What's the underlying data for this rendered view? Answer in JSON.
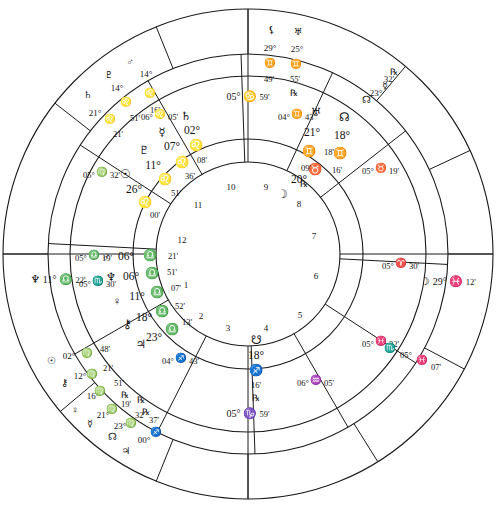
{
  "chart": {
    "type": "astrology-wheel",
    "geometry": {
      "cx": 248,
      "cy": 254,
      "r_outer": 245,
      "r_ring1": 200,
      "r_ring2": 178,
      "r_ring3": 115,
      "r_inner": 92
    },
    "stroke": "#1a1a1a",
    "background": "#ffffff"
  },
  "glyphs": {
    "sun": "☉",
    "moon": "☽",
    "mercury": "☿",
    "venus": "♀",
    "mars": "♂",
    "jupiter": "♃",
    "saturn": "♄",
    "uranus": "♅",
    "neptune": "♆",
    "pluto": "♇",
    "chiron": "⚷",
    "lilith": "⚸",
    "north-node": "☊",
    "south-node": "☋",
    "retrograde": "℞",
    "aries": "♈",
    "taurus": "♉",
    "gemini": "♊",
    "cancer": "♋",
    "leo": "♌",
    "virgo": "♍",
    "libra": "♎",
    "scorpio": "♏",
    "sagittarius": "♐",
    "capricorn": "♑",
    "aquarius": "♒",
    "pisces": "♓"
  },
  "axes": {
    "mc": {
      "name": "midheaven",
      "degree": "05°",
      "sign": "♋",
      "minute": "59'",
      "x": 248,
      "y": 96
    },
    "ic": {
      "name": "imum-coeli",
      "degree": "05°",
      "sign": "♑",
      "minute": "59'",
      "x": 248,
      "y": 413
    },
    "asc": {
      "name": "ascendant",
      "glyph": "♆",
      "degree": "11°",
      "sign": "♎",
      "minute": "22'",
      "x": 58,
      "y": 279
    },
    "dsc": {
      "name": "descendant",
      "glyph": "☽",
      "degree": "29°",
      "sign": "♓",
      "minute": "12'",
      "x": 448,
      "y": 281
    }
  },
  "house_numbers": [
    {
      "n": "1",
      "x": 186,
      "y": 285
    },
    {
      "n": "2",
      "x": 201,
      "y": 316
    },
    {
      "n": "3",
      "x": 228,
      "y": 328
    },
    {
      "n": "4",
      "x": 266,
      "y": 328
    },
    {
      "n": "5",
      "x": 300,
      "y": 315
    },
    {
      "n": "6",
      "x": 316,
      "y": 276
    },
    {
      "n": "7",
      "x": 314,
      "y": 236
    },
    {
      "n": "8",
      "x": 299,
      "y": 204
    },
    {
      "n": "9",
      "x": 266,
      "y": 187
    },
    {
      "n": "10",
      "x": 231,
      "y": 187
    },
    {
      "n": "11",
      "x": 198,
      "y": 205
    },
    {
      "n": "12",
      "x": 182,
      "y": 240
    }
  ],
  "inner_cusps": [
    {
      "name": "cusp-11",
      "degree": "06°",
      "sign": "♌",
      "minute": "05'",
      "x": 160,
      "y": 117
    },
    {
      "name": "cusp-10",
      "degree": "04°",
      "sign": "♊",
      "minute": "43'",
      "x": 297,
      "y": 117
    },
    {
      "name": "cusp-9",
      "degree": "05°",
      "sign": "♉",
      "minute": "19'",
      "x": 381,
      "y": 171
    },
    {
      "name": "cusp-8",
      "degree": "05°",
      "sign": "♈",
      "minute": "30'",
      "x": 401,
      "y": 266
    },
    {
      "name": "cusp-7",
      "degree": "05°",
      "sign": "♓",
      "minute": "32'",
      "x": 381,
      "y": 344
    },
    {
      "name": "cusp-6",
      "degree": "06°",
      "sign": "♒",
      "minute": "05'",
      "x": 316,
      "y": 383
    },
    {
      "name": "cusp-5",
      "degree": "04°",
      "sign": "♐",
      "minute": "43'",
      "x": 181,
      "y": 361
    },
    {
      "name": "cusp-4",
      "degree": "05°",
      "sign": "♏",
      "minute": "30'",
      "x": 98,
      "y": 284
    },
    {
      "name": "cusp-3",
      "degree": "05°",
      "sign": "♎",
      "minute": "19'",
      "x": 94,
      "y": 258
    },
    {
      "name": "cusp-2",
      "degree": "05°",
      "sign": "♍",
      "minute": "32'",
      "x": 102,
      "y": 175
    }
  ],
  "asc_marker": {
    "name": "ascendant-marker",
    "label": "♏",
    "degree": "05°",
    "sign": "♓",
    "minute": "07'",
    "x": 406,
    "y": 355
  },
  "inner_planets": [
    {
      "name": "saturn",
      "glyph": "♄",
      "degree": "02°",
      "sign": "♌",
      "minute": "08'",
      "retro": "",
      "gx": 186,
      "gy": 117,
      "dx": 192,
      "dy": 131,
      "sx": 196,
      "sy": 146,
      "mx": 202,
      "my": 160,
      "rx": 0,
      "ry": 0
    },
    {
      "name": "mercury",
      "glyph": "☿",
      "degree": "07°",
      "sign": "♌",
      "minute": "36'",
      "retro": "",
      "gx": 162,
      "gy": 133,
      "dx": 172,
      "dy": 147,
      "sx": 182,
      "sy": 163,
      "mx": 190,
      "my": 176,
      "rx": 0,
      "ry": 0
    },
    {
      "name": "pluto",
      "glyph": "♇",
      "degree": "11°",
      "sign": "♌",
      "minute": "51'",
      "retro": "",
      "gx": 144,
      "gy": 151,
      "dx": 153,
      "dy": 166,
      "sx": 165,
      "sy": 180,
      "mx": 176,
      "my": 193,
      "rx": 0,
      "ry": 0
    },
    {
      "name": "sun",
      "glyph": "☉",
      "degree": "26°",
      "sign": "♌",
      "minute": "00'",
      "retro": "",
      "gx": 125,
      "gy": 175,
      "dx": 134,
      "dy": 190,
      "sx": 145,
      "sy": 203,
      "mx": 155,
      "my": 215,
      "rx": 0,
      "ry": 0
    },
    {
      "name": "mars",
      "glyph": "♂",
      "degree": "06°",
      "sign": "♎",
      "minute": "21'",
      "retro": "",
      "gx": 106,
      "gy": 258,
      "dx": 126,
      "dy": 257,
      "sx": 150,
      "sy": 256,
      "mx": 173,
      "my": 256,
      "rx": 0,
      "ry": 0
    },
    {
      "name": "neptune",
      "glyph": "♆",
      "degree": "06°",
      "sign": "♎",
      "minute": "51'",
      "retro": "",
      "gx": 111,
      "gy": 278,
      "dx": 131,
      "dy": 277,
      "sx": 152,
      "sy": 274,
      "mx": 172,
      "my": 272,
      "rx": 0,
      "ry": 0
    },
    {
      "name": "venus",
      "glyph": "♀",
      "degree": "11°",
      "sign": "♎",
      "minute": "07'",
      "retro": "",
      "gx": 117,
      "gy": 302,
      "dx": 137,
      "dy": 297,
      "sx": 157,
      "sy": 293,
      "mx": 176,
      "my": 288,
      "rx": 0,
      "ry": 0
    },
    {
      "name": "chiron",
      "glyph": "⚷",
      "degree": "18°",
      "sign": "♎",
      "minute": "52'",
      "retro": "",
      "gx": 127,
      "gy": 325,
      "dx": 144,
      "dy": 318,
      "sx": 162,
      "sy": 312,
      "mx": 180,
      "my": 306,
      "rx": 0,
      "ry": 0
    },
    {
      "name": "jupiter",
      "glyph": "♃",
      "degree": "23°",
      "sign": "♎",
      "minute": "13'",
      "retro": "",
      "gx": 141,
      "gy": 345,
      "dx": 154,
      "dy": 338,
      "sx": 172,
      "sy": 330,
      "mx": 187,
      "my": 322,
      "rx": 0,
      "ry": 0
    },
    {
      "name": "south-node",
      "glyph": "☋",
      "degree": "18°",
      "sign": "♐",
      "minute": "16'",
      "retro": "℞",
      "gx": 256,
      "gy": 341,
      "dx": 256,
      "dy": 356,
      "sx": 256,
      "sy": 371,
      "mx": 256,
      "my": 385,
      "rx": 256,
      "ry": 398
    },
    {
      "name": "moon",
      "glyph": "♉",
      "degree": "20°",
      "sign": "",
      "minute": "18'",
      "retro": "",
      "gx": 315,
      "gy": 170,
      "dx": 299,
      "dy": 180,
      "sx": 0,
      "sy": 0,
      "mx": 329,
      "my": 152,
      "rx": 0,
      "ry": 0
    },
    {
      "name": "moon-body",
      "glyph": "☽",
      "degree": "",
      "sign": "",
      "minute": "",
      "retro": "",
      "gx": 282,
      "gy": 195,
      "dx": 0,
      "dy": 0,
      "sx": 0,
      "sy": 0,
      "mx": 0,
      "my": 0,
      "rx": 0,
      "ry": 0
    },
    {
      "name": "uranus",
      "glyph": "♅",
      "degree": "21°",
      "sign": "♊",
      "minute": "09'",
      "retro": "℞",
      "gx": 316,
      "gy": 113,
      "dx": 312,
      "dy": 133,
      "sx": 309,
      "sy": 152,
      "mx": 306,
      "my": 168,
      "rx": 304,
      "ry": 184
    },
    {
      "name": "north-node",
      "glyph": "☊",
      "degree": "18°",
      "sign": "♊",
      "minute": "16'",
      "retro": "",
      "gx": 344,
      "gy": 118,
      "dx": 342,
      "dy": 136,
      "sx": 340,
      "sy": 154,
      "mx": 337,
      "my": 170,
      "rx": 0,
      "ry": 0
    }
  ],
  "outer_planets": [
    {
      "name": "mars",
      "glyph": "♂",
      "degree": "14°",
      "sign": "♌",
      "minute": "16'",
      "retro": "",
      "gx": 130,
      "gy": 63,
      "dx": 146,
      "dy": 74,
      "sx": 150,
      "sy": 94,
      "mx": 155,
      "my": 110,
      "rx": 0,
      "ry": 0
    },
    {
      "name": "pluto",
      "glyph": "♇",
      "degree": "14°",
      "sign": "♌",
      "minute": "51'",
      "retro": "",
      "gx": 109,
      "gy": 76,
      "dx": 117,
      "dy": 88,
      "sx": 126,
      "sy": 103,
      "mx": 135,
      "my": 118,
      "rx": 0,
      "ry": 0
    },
    {
      "name": "saturn",
      "glyph": "♄",
      "degree": "21°",
      "sign": "♌",
      "minute": "21'",
      "retro": "",
      "gx": 88,
      "gy": 96,
      "dx": 95,
      "dy": 113,
      "sx": 110,
      "sy": 120,
      "mx": 118,
      "my": 134,
      "rx": 0,
      "ry": 0
    },
    {
      "name": "sun",
      "glyph": "☉",
      "degree": "02°",
      "sign": "♍",
      "minute": "48'",
      "retro": "",
      "gx": 51,
      "gy": 362,
      "dx": 69,
      "dy": 356,
      "sx": 87,
      "sy": 354,
      "mx": 105,
      "my": 349,
      "rx": 0,
      "ry": 0
    },
    {
      "name": "chiron",
      "glyph": "⚷",
      "degree": "12°",
      "sign": "♍",
      "minute": "21'",
      "retro": "",
      "gx": 64,
      "gy": 384,
      "dx": 80,
      "dy": 376,
      "sx": 92,
      "sy": 375,
      "mx": 108,
      "my": 368,
      "rx": 0,
      "ry": 0
    },
    {
      "name": "venus",
      "glyph": "♀",
      "degree": "16°",
      "sign": "♍",
      "minute": "51'",
      "retro": "℞",
      "gx": 75,
      "gy": 411,
      "dx": 93,
      "dy": 396,
      "sx": 100,
      "sy": 392,
      "mx": 119,
      "my": 383,
      "rx": 125,
      "ry": 395
    },
    {
      "name": "mercury",
      "glyph": "☿",
      "degree": "21°",
      "sign": "♍",
      "minute": "19'",
      "retro": "℞",
      "gx": 90,
      "gy": 425,
      "dx": 103,
      "dy": 415,
      "sx": 112,
      "sy": 410,
      "mx": 126,
      "my": 404,
      "rx": 141,
      "ry": 400
    },
    {
      "name": "north-node",
      "glyph": "☊",
      "degree": "23°",
      "sign": "♍",
      "minute": "32'",
      "retro": "℞",
      "gx": 112,
      "gy": 438,
      "dx": 120,
      "dy": 426,
      "sx": 131,
      "sy": 424,
      "mx": 140,
      "my": 415,
      "rx": 146,
      "ry": 412
    },
    {
      "name": "jupiter",
      "glyph": "♃",
      "degree": "00°",
      "sign": "♐",
      "minute": "37'",
      "retro": "",
      "gx": 126,
      "gy": 452,
      "dx": 144,
      "dy": 440,
      "sx": 156,
      "sy": 433,
      "mx": 154,
      "my": 420,
      "rx": 0,
      "ry": 0
    },
    {
      "name": "lilith",
      "glyph": "⚸",
      "degree": "29°",
      "sign": "♊",
      "minute": "49'",
      "retro": "",
      "gx": 271,
      "gy": 31,
      "dx": 270,
      "dy": 48,
      "sx": 270,
      "sy": 64,
      "mx": 269,
      "my": 79,
      "rx": 0,
      "ry": 0
    },
    {
      "name": "uranus",
      "glyph": "♅",
      "degree": "25°",
      "sign": "♊",
      "minute": "55'",
      "retro": "℞",
      "gx": 298,
      "gy": 33,
      "dx": 297,
      "dy": 49,
      "sx": 296,
      "sy": 65,
      "mx": 295,
      "my": 79,
      "rx": 294,
      "ry": 93
    },
    {
      "name": "north-node-outer",
      "glyph": "☊",
      "degree": "23°",
      "sign": "☿",
      "minute": "32'",
      "retro": "℞",
      "gx": 366,
      "gy": 101,
      "dx": 376,
      "dy": 93,
      "sx": 385,
      "sy": 87,
      "mx": 389,
      "my": 79,
      "rx": 394,
      "ry": 72
    }
  ]
}
